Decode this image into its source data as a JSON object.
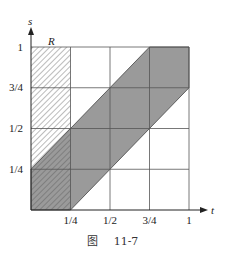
{
  "figure": {
    "caption_prefix": "图",
    "caption_number": "11-7",
    "x_axis_label": "t",
    "y_axis_label": "s",
    "region_label": "R",
    "x_ticks": [
      "1/4",
      "1/2",
      "3/4",
      "1"
    ],
    "y_ticks": [
      "1/4",
      "1/2",
      "3/4",
      "1"
    ],
    "colors": {
      "band_fill": "#9a9a9a",
      "grid": "#555555",
      "hatch": "#555555",
      "background": "#ffffff"
    },
    "regions": {
      "shaded_band": "|t - s| <= 1/4, 0<=t<=1, 0<=s<=1",
      "hatched_R": "0 <= t <= 1/4, 0 <= s <= 1"
    }
  }
}
